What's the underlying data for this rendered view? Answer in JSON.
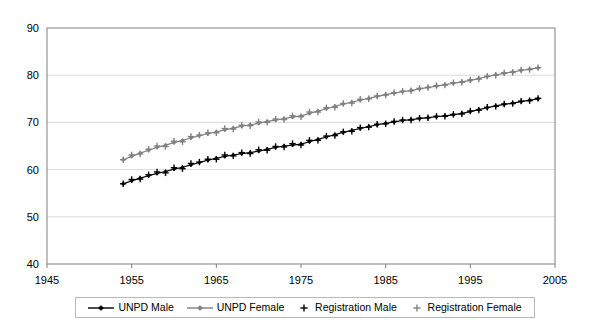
{
  "chart_data": {
    "type": "line",
    "title": "",
    "subtitle": "",
    "xlabel": "",
    "ylabel": "",
    "xlim": [
      1945,
      2005
    ],
    "ylim": [
      40,
      90
    ],
    "x_ticks": [
      1945,
      1955,
      1965,
      1975,
      1985,
      1995,
      2005
    ],
    "y_ticks": [
      40,
      50,
      60,
      70,
      80,
      90
    ],
    "grid": "horizontal",
    "legend_position": "bottom",
    "x": [
      1954,
      1955,
      1956,
      1957,
      1958,
      1959,
      1960,
      1961,
      1962,
      1963,
      1964,
      1965,
      1966,
      1967,
      1968,
      1969,
      1970,
      1971,
      1972,
      1973,
      1974,
      1975,
      1976,
      1977,
      1978,
      1979,
      1980,
      1981,
      1982,
      1983,
      1984,
      1985,
      1986,
      1987,
      1988,
      1989,
      1990,
      1991,
      1992,
      1993,
      1994,
      1995,
      1996,
      1997,
      1998,
      1999,
      2000,
      2001,
      2002,
      2003
    ],
    "series": [
      {
        "name": "UNPD Male",
        "marker": "diamond",
        "color": "#000000",
        "style": "line-marker",
        "values": [
          57.0,
          57.6,
          58.2,
          58.7,
          59.2,
          59.6,
          60.1,
          60.5,
          61.0,
          61.5,
          62.0,
          62.4,
          62.8,
          63.1,
          63.4,
          63.6,
          63.9,
          64.3,
          64.7,
          65.0,
          65.2,
          65.4,
          65.9,
          66.4,
          66.9,
          67.4,
          67.9,
          68.3,
          68.7,
          69.1,
          69.5,
          69.8,
          70.1,
          70.4,
          70.6,
          70.8,
          71.0,
          71.2,
          71.4,
          71.6,
          71.9,
          72.3,
          72.7,
          73.1,
          73.5,
          73.8,
          74.1,
          74.4,
          74.7,
          75.0
        ]
      },
      {
        "name": "UNPD Female",
        "marker": "diamond",
        "color": "#808080",
        "style": "line-marker",
        "values": [
          62.1,
          62.8,
          63.5,
          64.1,
          64.7,
          65.2,
          65.7,
          66.2,
          66.7,
          67.2,
          67.6,
          68.0,
          68.4,
          68.8,
          69.2,
          69.5,
          69.8,
          70.2,
          70.5,
          70.8,
          71.1,
          71.4,
          71.9,
          72.4,
          72.9,
          73.4,
          73.9,
          74.3,
          74.7,
          75.1,
          75.5,
          75.9,
          76.2,
          76.5,
          76.8,
          77.1,
          77.4,
          77.7,
          78.0,
          78.3,
          78.6,
          78.9,
          79.3,
          79.7,
          80.1,
          80.4,
          80.7,
          81.0,
          81.3,
          81.5
        ]
      },
      {
        "name": "Registration Male",
        "marker": "plus",
        "color": "#000000",
        "style": "marker-only",
        "values": [
          57.0,
          57.9,
          58.0,
          58.9,
          59.5,
          59.3,
          60.4,
          60.2,
          61.3,
          61.6,
          62.2,
          62.2,
          63.1,
          62.9,
          63.6,
          63.4,
          64.2,
          64.1,
          64.9,
          64.8,
          65.5,
          65.2,
          66.2,
          66.2,
          67.1,
          67.2,
          68.0,
          68.1,
          68.9,
          69.0,
          69.6,
          69.7,
          70.2,
          70.5,
          70.5,
          70.9,
          71.0,
          71.3,
          71.3,
          71.7,
          71.8,
          72.4,
          72.6,
          73.2,
          73.4,
          73.9,
          74.0,
          74.5,
          74.6,
          75.1
        ]
      },
      {
        "name": "Registration Female",
        "marker": "plus",
        "color": "#808080",
        "style": "marker-only",
        "values": [
          62.1,
          63.1,
          63.3,
          64.3,
          65.0,
          64.9,
          66.0,
          65.9,
          67.0,
          67.3,
          67.8,
          67.8,
          68.7,
          68.6,
          69.4,
          69.3,
          70.1,
          70.0,
          70.7,
          70.6,
          71.4,
          71.2,
          72.2,
          72.2,
          73.1,
          73.2,
          74.0,
          74.1,
          74.9,
          75.0,
          75.6,
          75.8,
          76.3,
          76.6,
          76.7,
          77.2,
          77.4,
          77.8,
          77.9,
          78.4,
          78.5,
          79.0,
          79.2,
          79.8,
          80.0,
          80.5,
          80.6,
          81.1,
          81.2,
          81.6
        ]
      }
    ],
    "legend": [
      {
        "label": "UNPD Male",
        "marker": "line-diamond",
        "color": "#000000"
      },
      {
        "label": "UNPD Female",
        "marker": "line-diamond",
        "color": "#808080"
      },
      {
        "label": "Registration Male",
        "marker": "plus",
        "color": "#000000"
      },
      {
        "label": "Registration Female",
        "marker": "plus",
        "color": "#808080"
      }
    ]
  },
  "colors": {
    "plot_border": "#808080",
    "gridline": "#d9d9d9",
    "background": "#ffffff",
    "male": "#000000",
    "female": "#808080",
    "legend_border": "#b9b9b9"
  }
}
